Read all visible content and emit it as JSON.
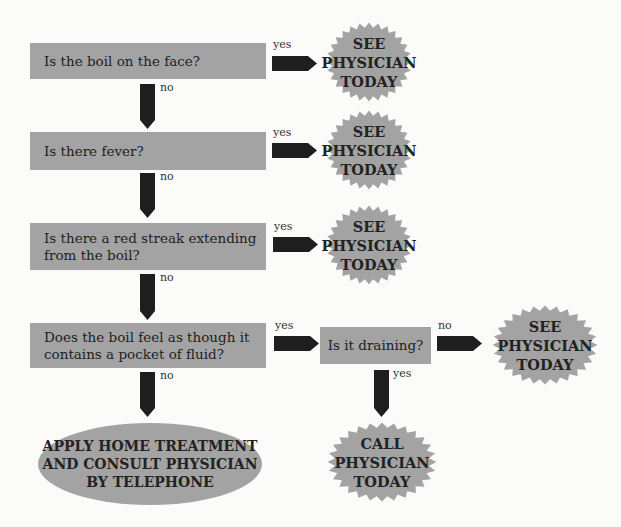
{
  "colors": {
    "box_fill": "#a3a3a3",
    "arrow_fill": "#1e1e1e",
    "background": "#fbfbfa"
  },
  "questions": [
    {
      "id": "q1",
      "lines": [
        "Is the boil on the face?"
      ]
    },
    {
      "id": "q2",
      "lines": [
        "Is there fever?"
      ]
    },
    {
      "id": "q3",
      "lines": [
        "Is there a red streak extending",
        "from the boil?"
      ]
    },
    {
      "id": "q4",
      "lines": [
        "Does the boil feel as though it",
        "contains a pocket of fluid?"
      ]
    },
    {
      "id": "q5",
      "lines": [
        "Is it draining?"
      ]
    }
  ],
  "outcomes": [
    {
      "id": "o1",
      "shape": "starburst",
      "lines": [
        "SEE",
        "PHYSICIAN",
        "TODAY"
      ]
    },
    {
      "id": "o2",
      "shape": "starburst",
      "lines": [
        "SEE",
        "PHYSICIAN",
        "TODAY"
      ]
    },
    {
      "id": "o3",
      "shape": "starburst",
      "lines": [
        "SEE",
        "PHYSICIAN",
        "TODAY"
      ]
    },
    {
      "id": "o4",
      "shape": "starburst",
      "lines": [
        "SEE",
        "PHYSICIAN",
        "TODAY"
      ]
    },
    {
      "id": "o5",
      "shape": "starburst",
      "lines": [
        "CALL",
        "PHYSICIAN",
        "TODAY"
      ]
    },
    {
      "id": "o6",
      "shape": "ellipse",
      "lines": [
        "APPLY HOME TREATMENT",
        "AND CONSULT PHYSICIAN",
        "BY TELEPHONE"
      ]
    }
  ],
  "edges": [
    {
      "from": "q1",
      "to": "o1",
      "label": "yes"
    },
    {
      "from": "q1",
      "to": "q2",
      "label": "no"
    },
    {
      "from": "q2",
      "to": "o2",
      "label": "yes"
    },
    {
      "from": "q2",
      "to": "q3",
      "label": "no"
    },
    {
      "from": "q3",
      "to": "o3",
      "label": "yes"
    },
    {
      "from": "q3",
      "to": "q4",
      "label": "no"
    },
    {
      "from": "q4",
      "to": "q5",
      "label": "yes"
    },
    {
      "from": "q4",
      "to": "o6",
      "label": "no"
    },
    {
      "from": "q5",
      "to": "o4",
      "label": "no"
    },
    {
      "from": "q5",
      "to": "o5",
      "label": "yes"
    }
  ]
}
